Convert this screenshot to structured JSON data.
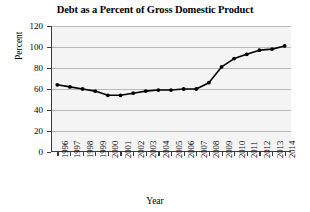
{
  "chart_data": {
    "type": "line",
    "title": "Debt as a Percent of Gross Domestic Product",
    "xlabel": "Year",
    "ylabel": "Percent",
    "categories": [
      "1996",
      "1997",
      "1998",
      "1999",
      "2000",
      "2001",
      "2002",
      "2003",
      "2004",
      "2005",
      "2006",
      "2007",
      "2008",
      "2009",
      "2010",
      "2011",
      "2012",
      "2013",
      "2014"
    ],
    "values": [
      64,
      62,
      60,
      58,
      54,
      54,
      56,
      58,
      59,
      59,
      60,
      60,
      66,
      81,
      89,
      93,
      97,
      98,
      101
    ],
    "series": [
      {
        "name": "Debt as a Percent of GDP",
        "values": [
          64,
          62,
          60,
          58,
          54,
          54,
          56,
          58,
          59,
          59,
          60,
          60,
          66,
          81,
          89,
          93,
          97,
          98,
          101
        ]
      }
    ],
    "ylim": [
      0,
      120
    ],
    "yticks": [
      0,
      20,
      40,
      60,
      80,
      100,
      120
    ],
    "ytick_labels": [
      "0",
      "20",
      "40",
      "60",
      "80",
      "100",
      "120"
    ],
    "xtick_labels": [
      "1996",
      "1997",
      "1998",
      "1999",
      "2000",
      "2001",
      "2002",
      "2003",
      "2004",
      "2005",
      "2006",
      "2007",
      "2008",
      "2009",
      "2010",
      "2011",
      "2012",
      "2013",
      "2014"
    ],
    "grid": "horizontal",
    "legend": "none",
    "line_color": "#000000",
    "marker": "circle",
    "marker_color": "#000000",
    "plot_background": "#f4f4f4",
    "gridline_color": "#b9b9b9",
    "axis_color": "#3a3a3a"
  }
}
